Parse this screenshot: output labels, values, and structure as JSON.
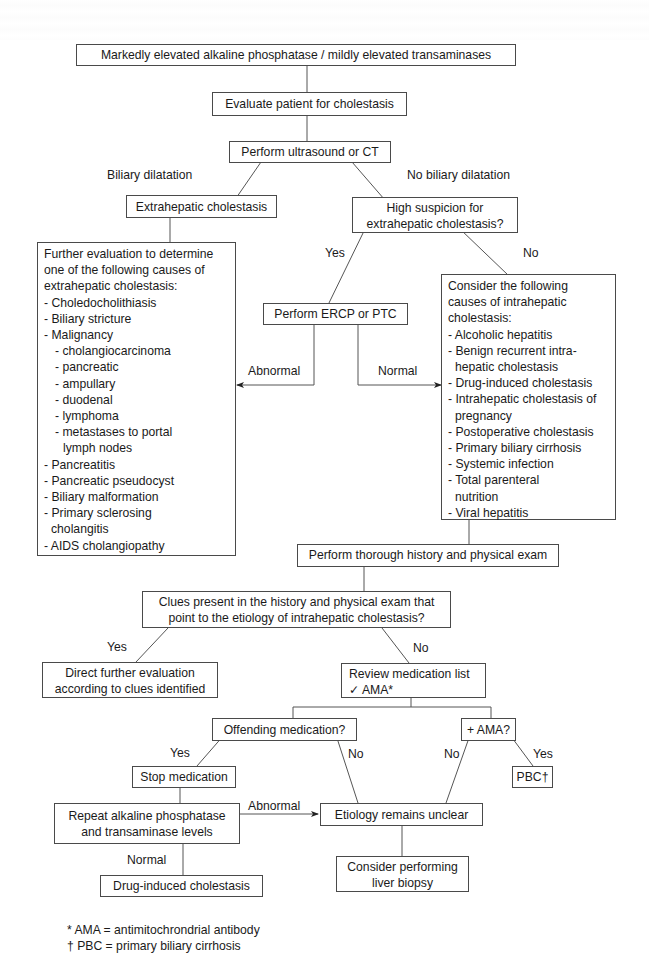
{
  "diagram": {
    "nodes": {
      "start": "Markedly elevated alkaline phosphatase / mildly elevated transaminases",
      "evaluate": "Evaluate patient for cholestasis",
      "imaging": "Perform ultrasound or CT",
      "extrahepatic": "Extrahepatic cholestasis",
      "high_suspicion": [
        "High suspicion for",
        "extrahepatic cholestasis?"
      ],
      "ercp": "Perform ERCP or PTC",
      "extrahepatic_causes": {
        "intro": [
          "Further evaluation to determine",
          "one of the following causes of",
          "extrahepatic cholestasis:"
        ],
        "items": [
          "- Choledocholithiasis",
          "- Biliary stricture",
          "- Malignancy",
          "- cholangiocarcinoma",
          "- pancreatic",
          "- ampullary",
          "- duodenal",
          "- lymphoma",
          "- metastases to portal",
          "lymph nodes",
          "- Pancreatitis",
          "- Pancreatic pseudocyst",
          "- Biliary malformation",
          "- Primary sclerosing",
          "cholangitis",
          "- AIDS cholangiopathy"
        ]
      },
      "intrahepatic_causes": {
        "intro": [
          "Consider the following",
          "causes of intrahepatic",
          "cholestasis:"
        ],
        "items": [
          "- Alcoholic hepatitis",
          "- Benign recurrent intra-",
          "hepatic cholestasis",
          "- Drug-induced cholestasis",
          "- Intrahepatic cholestasis of",
          "pregnancy",
          "- Postoperative cholestasis",
          "- Primary biliary cirrhosis",
          "- Systemic infection",
          "- Total parenteral",
          "nutrition",
          "- Viral hepatitis"
        ]
      },
      "history_exam": "Perform thorough history and physical exam",
      "clues": [
        "Clues present in the history and physical exam that",
        "point to the etiology of intrahepatic cholestasis?"
      ],
      "direct_eval": [
        "Direct further evaluation",
        "according to clues identified"
      ],
      "review_meds": [
        "Review medication list",
        "✓ AMA*"
      ],
      "offending_med": "Offending medication?",
      "plus_ama": "+ AMA?",
      "stop_med": "Stop medication",
      "pbc": "PBC†",
      "repeat_labs": [
        "Repeat alkaline phosphatase",
        "and transaminase levels"
      ],
      "unclear": "Etiology remains unclear",
      "drug_induced": "Drug-induced cholestasis",
      "biopsy": [
        "Consider performing",
        "liver biopsy"
      ]
    },
    "edge_labels": {
      "biliary_dilatation": "Biliary dilatation",
      "no_biliary_dilatation": "No biliary dilatation",
      "suspicion_yes": "Yes",
      "suspicion_no": "No",
      "ercp_abnormal": "Abnormal",
      "ercp_normal": "Normal",
      "clues_yes": "Yes",
      "clues_no": "No",
      "offending_yes": "Yes",
      "offending_no": "No",
      "ama_no": "No",
      "ama_yes": "Yes",
      "repeat_abnormal": "Abnormal",
      "repeat_normal": "Normal"
    },
    "footnotes": [
      "* AMA = antimitochrondrial antibody",
      "† PBC = primary biliary cirrhosis"
    ]
  }
}
